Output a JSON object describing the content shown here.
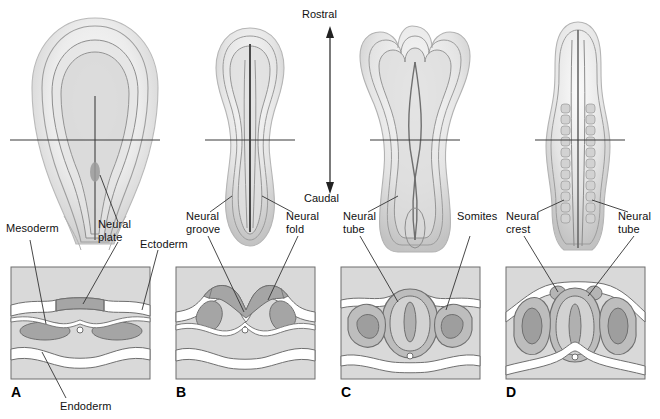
{
  "figure": {
    "axis": {
      "rostral_label": "Rostral",
      "caudal_label": "Caudal",
      "arrow_name": "rostral-caudal-axis-arrow"
    },
    "colors": {
      "panel_background": "#d9d9d9",
      "panel_border": "#6e6e6e",
      "ectoderm_fill": "#ffffff",
      "mesoderm_fill": "#a8a8a8",
      "neural_fill": "#bdbdbd",
      "neural_dark": "#9a9a9a",
      "outline": "#555555",
      "embryo_light": "#f2f2f2",
      "embryo_mid": "#d5d5d5",
      "embryo_shade": "#b6b6b6",
      "leader_line": "#333333",
      "text": "#111111"
    },
    "stages": [
      {
        "letter": "A",
        "name": "neural-plate-stage",
        "labels": [
          {
            "text": "Mesoderm",
            "name": "label-mesoderm"
          },
          {
            "text": "Neural\nplate",
            "name": "label-neural-plate"
          },
          {
            "text": "Ectoderm",
            "name": "label-ectoderm"
          },
          {
            "text": "Endoderm",
            "name": "label-endoderm"
          }
        ]
      },
      {
        "letter": "B",
        "name": "neural-groove-stage",
        "labels": [
          {
            "text": "Neural\ngroove",
            "name": "label-neural-groove"
          },
          {
            "text": "Neural\nfold",
            "name": "label-neural-fold"
          }
        ]
      },
      {
        "letter": "C",
        "name": "neural-tube-closure-stage",
        "labels": [
          {
            "text": "Neural\ntube",
            "name": "label-neural-tube-c"
          },
          {
            "text": "Somites",
            "name": "label-somites"
          }
        ]
      },
      {
        "letter": "D",
        "name": "neural-crest-stage",
        "labels": [
          {
            "text": "Neural\ncrest",
            "name": "label-neural-crest"
          },
          {
            "text": "Neural\ntube",
            "name": "label-neural-tube-d"
          }
        ]
      }
    ]
  }
}
